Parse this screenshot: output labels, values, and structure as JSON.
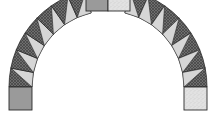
{
  "diagram": {
    "segments_per_side": 7,
    "colors": {
      "dark_fill": "#6e6e6e",
      "dark_hatch": "#3a3a3a",
      "light_triangle": "#d6d6d6",
      "square_gray": "#9a9a9a",
      "square_speckle": "#e2e2e2",
      "outline": "#2a2a2a"
    },
    "squares": [
      {
        "name": "top-left-square",
        "fill": "gray"
      },
      {
        "name": "top-right-square",
        "fill": "speckle"
      },
      {
        "name": "bottom-left-square",
        "fill": "gray"
      },
      {
        "name": "bottom-right-square",
        "fill": "speckle"
      }
    ]
  }
}
